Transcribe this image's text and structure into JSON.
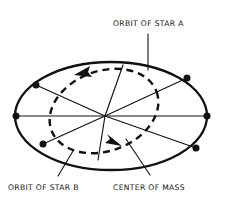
{
  "figure": {
    "title_visible": false,
    "background_color": "#ffffff",
    "ink_color": "#111111"
  },
  "labels": {
    "orbit_star_a": "ORBIT OF STAR A",
    "orbit_star_b": "ORBIT OF STAR B",
    "center_of_mass": "CENTER OF MASS"
  },
  "diagram_data": {
    "type": "astronomy-binary-star-orbit-diagram",
    "center_of_mass": {
      "x": 105,
      "y": 116
    },
    "orbits": [
      {
        "name": "ORBIT OF STAR A",
        "style": "solid",
        "shape": "ellipse",
        "cx": 111,
        "cy": 116,
        "rx": 96,
        "ry": 54,
        "rotation_deg": 0,
        "stroke_width": 2.3,
        "direction": "counterclockwise",
        "arrow_label": "direction-of-motion-star-a"
      },
      {
        "name": "ORBIT OF STAR B",
        "style": "dashed",
        "shape": "ellipse",
        "cx": 104,
        "cy": 111,
        "rx": 56,
        "ry": 40,
        "rotation_deg": -20,
        "stroke_width": 2.4,
        "dash_pattern": "7 5",
        "direction": "counterclockwise",
        "arrow_label": "direction-of-motion-star-b"
      }
    ],
    "position_markers_star_a": [
      {
        "x": 16,
        "y": 116
      },
      {
        "x": 36,
        "y": 85
      },
      {
        "x": 43,
        "y": 144
      },
      {
        "x": 187,
        "y": 78
      },
      {
        "x": 196,
        "y": 148
      },
      {
        "x": 207,
        "y": 116
      }
    ],
    "radial_connector_count": 6,
    "leader_lines": [
      {
        "from_label": "ORBIT OF STAR A",
        "x1": 148,
        "y1": 33,
        "x2": 148,
        "y2": 70
      },
      {
        "from_label": "ORBIT OF STAR B",
        "x1": 58,
        "y1": 178,
        "x2": 72,
        "y2": 152
      },
      {
        "from_label": "CENTER OF MASS",
        "x1": 148,
        "y1": 177,
        "x2": 127,
        "y2": 140
      }
    ]
  }
}
